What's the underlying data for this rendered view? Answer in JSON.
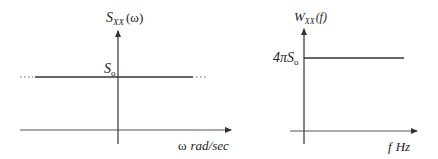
{
  "diagram": {
    "colors": {
      "line": "#333333",
      "text": "#222222",
      "background": "#ffffff"
    },
    "left_panel": {
      "y_axis_label": {
        "main": "S",
        "sub": "XX",
        "arg": "(ω)"
      },
      "level_label": {
        "main": "S",
        "sub": "o"
      },
      "x_axis_label": {
        "symbol": "ω",
        "unit": "rad/sec"
      },
      "level_line": "constant S_o extending to ±∞ (dotted ends)"
    },
    "right_panel": {
      "y_axis_label": {
        "main": "W",
        "sub": "XX",
        "arg": "(f)"
      },
      "level_label": {
        "prefix": "4π",
        "main": "S",
        "sub": "o"
      },
      "x_axis_label": {
        "symbol": "f",
        "unit": "Hz"
      },
      "level_line": "constant 4πS_o for f ≥ 0"
    }
  }
}
